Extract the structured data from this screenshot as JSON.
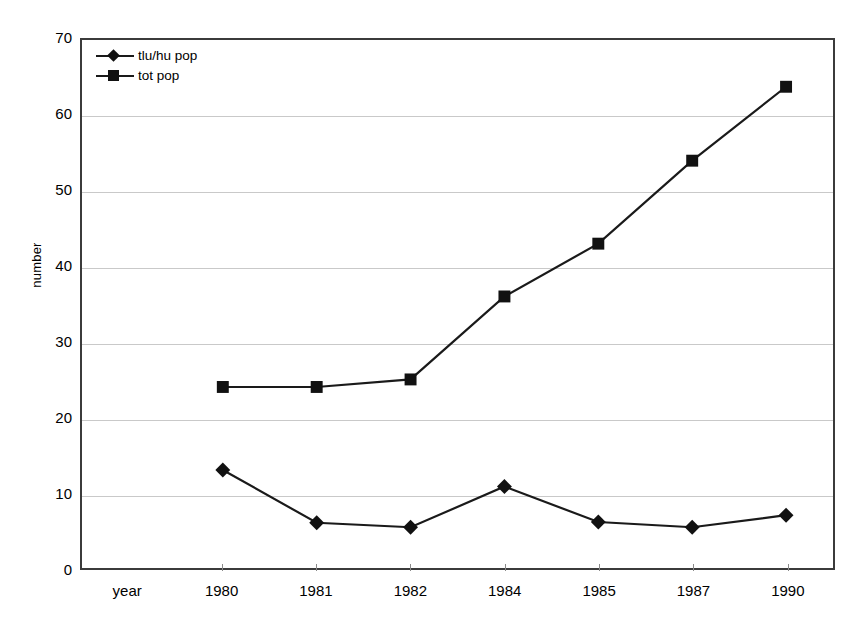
{
  "chart_data": {
    "type": "line",
    "title": "",
    "xlabel": "year",
    "ylabel": "number",
    "ylim": [
      0,
      70
    ],
    "ytick_step": 10,
    "yticks": [
      0,
      10,
      20,
      30,
      40,
      50,
      60,
      70
    ],
    "grid": true,
    "legend_position": "top-left",
    "categories": [
      "year",
      "1980",
      "1981",
      "1982",
      "1984",
      "1985",
      "1987",
      "1990"
    ],
    "x": [
      "",
      "1980",
      "1981",
      "1982",
      "1984",
      "1985",
      "1987",
      "1990"
    ],
    "series": [
      {
        "name": "tlu/hu pop",
        "marker": "diamond",
        "color": "#111111",
        "values": [
          null,
          13.0,
          6.0,
          5.4,
          10.8,
          6.1,
          5.4,
          7.0
        ]
      },
      {
        "name": "tot pop",
        "marker": "square",
        "color": "#111111",
        "values": [
          null,
          24.0,
          24.0,
          25.0,
          36.0,
          43.0,
          54.0,
          63.8
        ]
      }
    ]
  },
  "axes": {
    "y_title": "number",
    "y_tick_labels": [
      "70",
      "60",
      "50",
      "40",
      "30",
      "20",
      "10",
      "0"
    ],
    "x_tick_labels": [
      "year",
      "1980",
      "1981",
      "1982",
      "1984",
      "1985",
      "1987",
      "1990"
    ]
  },
  "legend": {
    "items": [
      {
        "label": "tlu/hu pop",
        "marker": "diamond-marker"
      },
      {
        "label": "tot pop",
        "marker": "square-marker"
      }
    ]
  },
  "colors": {
    "line": "#1a1a1a",
    "marker": "#111111",
    "grid": "#c9c9c9",
    "frame": "#3b3b3b",
    "background": "#ffffff"
  }
}
